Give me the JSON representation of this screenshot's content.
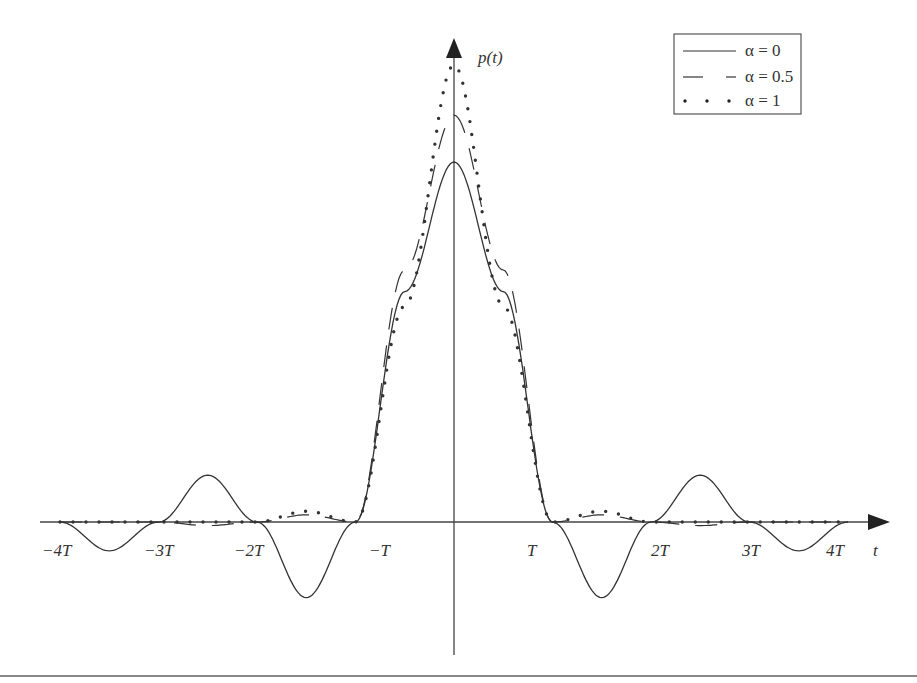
{
  "chart_data": {
    "type": "line",
    "title": "",
    "xlabel": "t",
    "ylabel": "p(t)",
    "x_unit": "T",
    "xlim": [
      -4,
      4
    ],
    "x_ticks": [
      -4,
      -3,
      -2,
      -1,
      1,
      2,
      3,
      4
    ],
    "x_tick_labels": [
      "−4T",
      "−3T",
      "−2T",
      "−T",
      "T",
      "2T",
      "3T",
      "4T"
    ],
    "grid": false,
    "legend_position": "upper right",
    "legend": [
      "α = 0",
      "α = 0.5",
      "α = 1"
    ],
    "series": [
      {
        "name": "α = 0",
        "style": "solid",
        "description": "sinc pulse with zero crossings at integer multiples of T",
        "x": [
          -4,
          -3.5,
          -3,
          -2.5,
          -2,
          -1.5,
          -1,
          -0.5,
          0,
          0.5,
          1,
          1.5,
          2,
          2.5,
          3,
          3.5,
          4
        ],
        "y": [
          0,
          -0.08,
          0,
          0.13,
          0,
          -0.21,
          0,
          0.64,
          1.0,
          0.64,
          0,
          -0.21,
          0,
          0.13,
          0,
          -0.08,
          0
        ]
      },
      {
        "name": "α = 0.5",
        "style": "dashed",
        "description": "raised-cosine pulse, faster-decaying sidelobes",
        "x": [
          -4,
          -3,
          -2.5,
          -2,
          -1.5,
          -1,
          -0.5,
          0,
          0.5,
          1,
          1.5,
          2,
          2.5,
          3,
          4
        ],
        "y": [
          0,
          0,
          -0.01,
          0,
          0.02,
          0,
          0.7,
          1.13,
          0.7,
          0,
          0.02,
          0,
          -0.01,
          0,
          0
        ]
      },
      {
        "name": "α = 1",
        "style": "dotted",
        "description": "raised-cosine pulse, narrowest main lobe and smallest sidelobes",
        "x": [
          -4,
          -3,
          -2,
          -1.5,
          -1,
          -0.5,
          0,
          0.5,
          1,
          1.5,
          2,
          3,
          4
        ],
        "y": [
          0,
          0,
          0,
          0.03,
          0,
          0.6,
          1.27,
          0.6,
          0,
          0.03,
          0,
          0,
          0
        ]
      }
    ]
  },
  "axes": {
    "x_label": "t",
    "y_label": "p(t)",
    "ticks": [
      "−4T",
      "−3T",
      "−2T",
      "−T",
      "T",
      "2T",
      "3T",
      "4T"
    ]
  },
  "legend": {
    "items": [
      {
        "label": "α = 0",
        "style": "solid"
      },
      {
        "label": "α = 0.5",
        "style": "dashed"
      },
      {
        "label": "α = 1",
        "style": "dotted"
      }
    ]
  }
}
